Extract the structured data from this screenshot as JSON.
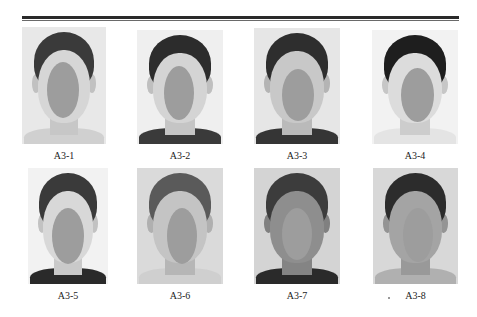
{
  "figure": {
    "colors": {
      "oval": "#9d9d9d",
      "rule": "#2a2a2a",
      "label_text": "#222222"
    },
    "photos": [
      {
        "label": "A3-1",
        "x": 22,
        "y": 27,
        "w": 84,
        "h": 117,
        "bg": "#e8e8e8",
        "hair": "#3a3a3a",
        "skin": "#d6d6d6",
        "shirt": "#d0d0d0",
        "oval_x": 25,
        "oval_y": 35,
        "oval_w": 32,
        "oval_h": 56
      },
      {
        "label": "A3-2",
        "x": 137,
        "y": 30,
        "w": 86,
        "h": 114,
        "bg": "#efefef",
        "hair": "#2c2c2c",
        "skin": "#d4d4d4",
        "shirt": "#3a3a3a",
        "oval_x": 27,
        "oval_y": 36,
        "oval_w": 30,
        "oval_h": 54
      },
      {
        "label": "A3-3",
        "x": 254,
        "y": 28,
        "w": 86,
        "h": 116,
        "bg": "#e6e6e6",
        "hair": "#2e2e2e",
        "skin": "#c8c8c8",
        "shirt": "#353535",
        "oval_x": 28,
        "oval_y": 41,
        "oval_w": 32,
        "oval_h": 52
      },
      {
        "label": "A3-4",
        "x": 372,
        "y": 30,
        "w": 86,
        "h": 114,
        "bg": "#f2f2f2",
        "hair": "#1e1e1e",
        "skin": "#dcdcdc",
        "shirt": "#e4e4e4",
        "oval_x": 29,
        "oval_y": 38,
        "oval_w": 33,
        "oval_h": 54
      },
      {
        "label": "A3-5",
        "x": 28,
        "y": 168,
        "w": 80,
        "h": 116,
        "bg": "#f2f2f2",
        "hair": "#3a3a3a",
        "skin": "#d8d8d8",
        "shirt": "#2a2a2a",
        "oval_x": 24,
        "oval_y": 40,
        "oval_w": 32,
        "oval_h": 56
      },
      {
        "label": "A3-6",
        "x": 137,
        "y": 168,
        "w": 86,
        "h": 116,
        "bg": "#dadada",
        "hair": "#5a5a5a",
        "skin": "#c4c4c4",
        "shirt": "#cfcfcf",
        "oval_x": 30,
        "oval_y": 40,
        "oval_w": 30,
        "oval_h": 56
      },
      {
        "label": "A3-7",
        "x": 254,
        "y": 168,
        "w": 86,
        "h": 116,
        "bg": "#d4d4d4",
        "hair": "#3c3c3c",
        "skin": "#8e8e8e",
        "shirt": "#2a2a2a",
        "oval_x": 28,
        "oval_y": 40,
        "oval_w": 30,
        "oval_h": 52
      },
      {
        "label": "A3-8",
        "x": 373,
        "y": 168,
        "w": 85,
        "h": 116,
        "bg": "#d8d8d8",
        "hair": "#2c2c2c",
        "skin": "#a4a4a4",
        "shirt": "#b0b0b0",
        "oval_x": 30,
        "oval_y": 40,
        "oval_w": 30,
        "oval_h": 54
      }
    ]
  }
}
